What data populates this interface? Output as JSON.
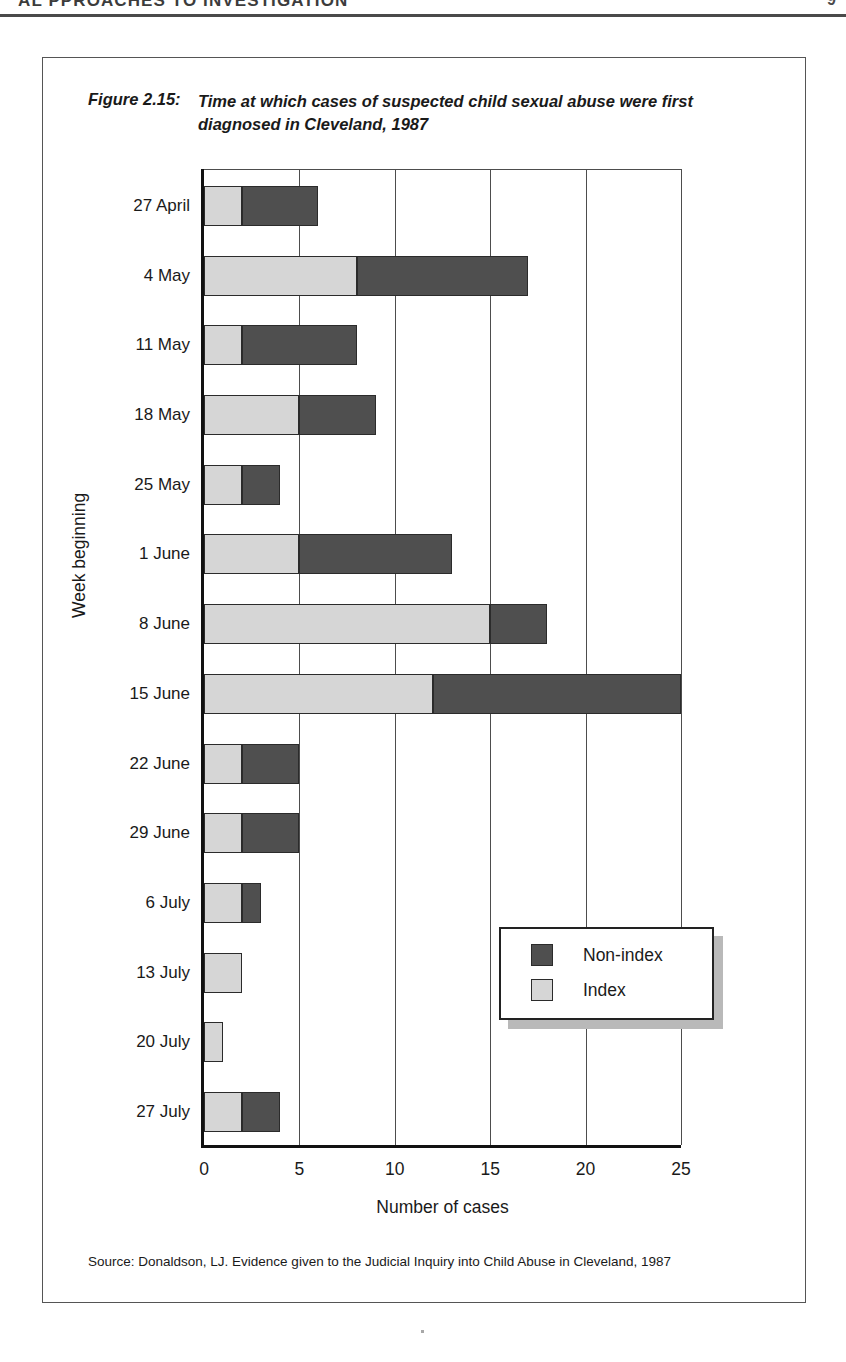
{
  "page_header": {
    "running_title": "AL PPROACHES TO INVESTIGATION",
    "page_number": "9"
  },
  "figure": {
    "caption_number": "Figure 2.15:",
    "caption_title": "Time at which cases of suspected child sexual abuse were first diagnosed in Cleveland, 1987",
    "source": "Source: Donaldson, LJ. Evidence given to the Judicial Inquiry into Child Abuse in Cleveland, 1987"
  },
  "legend": {
    "items": [
      {
        "label": "Non-index",
        "color": "#4f4f4f",
        "swatch": "nonindex-swatch"
      },
      {
        "label": "Index",
        "color": "#d6d6d6",
        "swatch": "index-swatch"
      }
    ]
  },
  "chart_data": {
    "type": "bar",
    "orientation": "horizontal",
    "stacked": true,
    "title": "Time at which cases of suspected child sexual abuse were first diagnosed in Cleveland, 1987",
    "xlabel": "Number of cases",
    "ylabel": "Week beginning",
    "xlim": [
      0,
      25
    ],
    "xticks": [
      0,
      5,
      10,
      15,
      20,
      25
    ],
    "xtick_labels": [
      "0",
      "5",
      "10",
      "15",
      "20",
      "25"
    ],
    "grid": "vertical",
    "legend_position": "inside-lower-right",
    "categories": [
      "27 April",
      "4 May",
      "11 May",
      "18 May",
      "25 May",
      "1 June",
      "8 June",
      "15 June",
      "22 June",
      "29 June",
      "6 July",
      "13 July",
      "20 July",
      "27 July"
    ],
    "series": [
      {
        "name": "Index",
        "color": "#d6d6d6",
        "values": [
          2,
          8,
          2,
          5,
          2,
          5,
          15,
          12,
          2,
          2,
          2,
          2,
          1,
          2
        ]
      },
      {
        "name": "Non-index",
        "color": "#4f4f4f",
        "values": [
          4,
          9,
          6,
          4,
          2,
          8,
          3,
          13,
          3,
          3,
          1,
          0,
          0,
          2
        ]
      }
    ],
    "totals": [
      6,
      17,
      8,
      9,
      4,
      13,
      18,
      25,
      5,
      5,
      3,
      2,
      1,
      4
    ]
  }
}
